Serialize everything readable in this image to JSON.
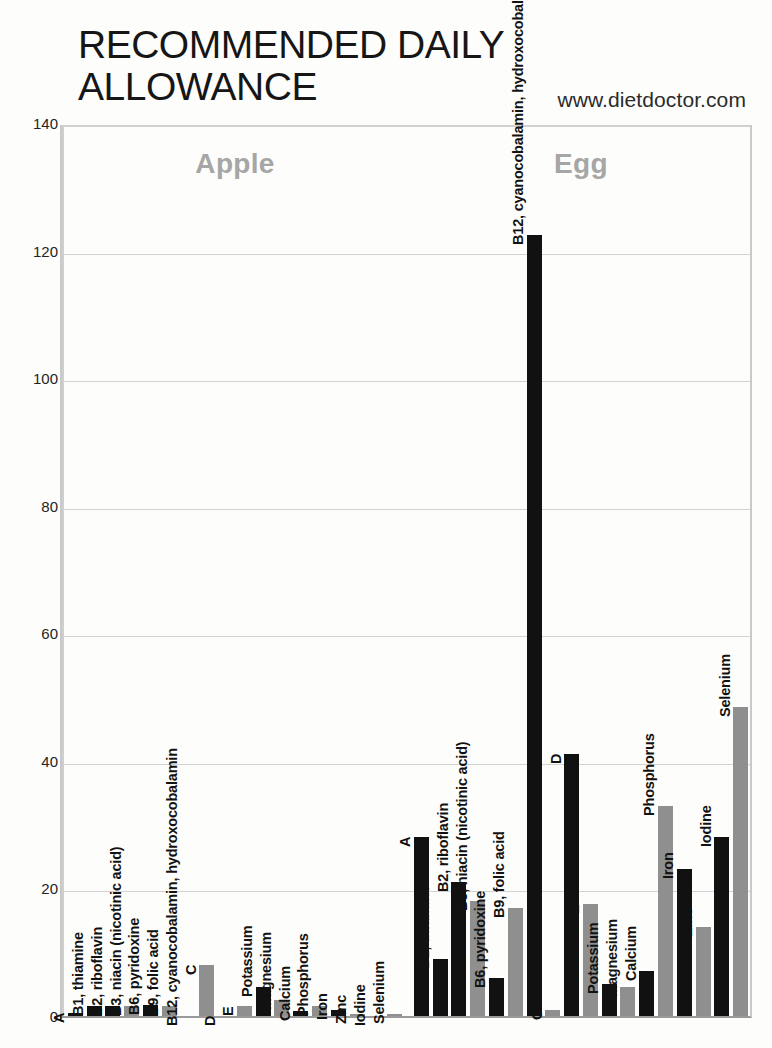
{
  "header": {
    "title": "RECOMMENDED DAILY ALLOWANCE",
    "site": "www.dietdoctor.com"
  },
  "axis": {
    "ticks": [
      "0",
      "20",
      "40",
      "60",
      "80",
      "100",
      "120",
      "140"
    ]
  },
  "panels": [
    {
      "name": "Apple"
    },
    {
      "name": "Egg"
    }
  ],
  "colors": {
    "dark_series": "#111111",
    "gray_series": "#8f8f8f",
    "caption": "#a6a6a6",
    "gridline": "#d2d2d2"
  },
  "chart_data": {
    "type": "bar",
    "title": "RECOMMENDED DAILY ALLOWANCE",
    "subtitle": "www.dietdoctor.com",
    "xlabel": "",
    "ylabel": "",
    "ylim": [
      0,
      140
    ],
    "yticks": [
      0,
      20,
      40,
      60,
      80,
      100,
      120,
      140
    ],
    "grid": true,
    "legend": "none",
    "categories": [
      "A",
      "B1, thiamine",
      "B2, riboflavin",
      "B3, niacin (nicotinic acid)",
      "B6, pyridoxine",
      "B9, folic acid",
      "B12, cyanocobalamin, hydroxocobalamin",
      "C",
      "D",
      "E",
      "Potassium",
      "Magnesium",
      "Calcium",
      "Phosphorus",
      "Iron",
      "Zinc",
      "Iodine",
      "Selenium"
    ],
    "series": [
      {
        "name": "Apple",
        "values": [
          0.5,
          1.5,
          1.5,
          1.5,
          1.7,
          1.5,
          0,
          8,
          0,
          1.5,
          4.5,
          2.5,
          0.8,
          1.5,
          1.0,
          0.3,
          0,
          0.3
        ]
      },
      {
        "name": "Egg",
        "values": [
          28,
          9,
          21,
          18,
          6,
          17,
          122.5,
          1,
          41,
          17.5,
          5,
          4.5,
          7,
          33,
          23,
          14,
          28,
          48.5
        ]
      }
    ],
    "color_by_index": [
      "dark",
      "dark",
      "dark",
      "gray",
      "dark",
      "gray",
      "dark",
      "gray",
      "dark",
      "gray",
      "dark",
      "gray",
      "dark",
      "gray",
      "dark",
      "gray",
      "dark",
      "gray"
    ]
  }
}
